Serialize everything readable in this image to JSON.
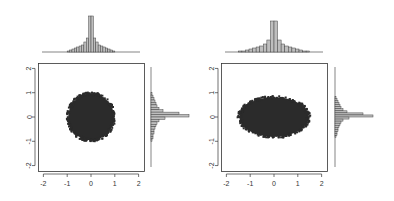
{
  "figure": {
    "colors": {
      "points": "#2b2b2b",
      "bars_fill": "#bebebe",
      "bars_stroke": "#444444",
      "axis": "#333333",
      "background": "#ffffff"
    }
  },
  "chart_data": [
    {
      "type": "scatter",
      "title": "",
      "xlabel": "",
      "ylabel": "",
      "xlim": [
        -2.1,
        2.1
      ],
      "ylim": [
        -2.1,
        2.1
      ],
      "x_ticks": [
        "-2",
        "-1",
        "0",
        "1",
        "2"
      ],
      "y_ticks": [
        "-2",
        "-1",
        "0",
        "1",
        "2"
      ],
      "grid": false,
      "shape": "circle",
      "center": [
        0,
        0
      ],
      "radius_x": 1.0,
      "radius_y": 1.0,
      "marginal_top": {
        "type": "bar",
        "bins": [
          -1.0,
          -0.9,
          -0.8,
          -0.7,
          -0.6,
          -0.5,
          -0.4,
          -0.3,
          -0.2,
          -0.1,
          0.0,
          0.1,
          0.2,
          0.3,
          0.4,
          0.5,
          0.6,
          0.7,
          0.8,
          0.9
        ],
        "values": [
          1,
          2,
          3,
          4,
          5,
          6,
          7,
          10,
          14,
          36,
          36,
          14,
          10,
          7,
          6,
          5,
          4,
          3,
          2,
          1
        ]
      },
      "marginal_right": {
        "type": "bar",
        "bins": [
          1.0,
          0.9,
          0.8,
          0.7,
          0.6,
          0.5,
          0.4,
          0.3,
          0.2,
          0.1,
          0.0,
          -0.1,
          -0.2,
          -0.3,
          -0.4,
          -0.5,
          -0.6,
          -0.7,
          -0.8,
          -0.9
        ],
        "values": [
          1,
          2,
          3,
          4,
          5,
          6,
          8,
          12,
          28,
          38,
          14,
          8,
          6,
          5,
          4,
          3,
          3,
          2,
          2,
          1
        ]
      }
    },
    {
      "type": "scatter",
      "title": "",
      "xlabel": "",
      "ylabel": "",
      "xlim": [
        -2.1,
        2.1
      ],
      "ylim": [
        -2.1,
        2.1
      ],
      "x_ticks": [
        "-2",
        "-1",
        "0",
        "1",
        "2"
      ],
      "y_ticks": [
        "-2",
        "-1",
        "0",
        "1",
        "2"
      ],
      "grid": false,
      "shape": "ellipse",
      "center": [
        0,
        0
      ],
      "radius_x": 1.5,
      "radius_y": 0.85,
      "marginal_top": {
        "type": "bar",
        "bins": [
          -1.5,
          -1.35,
          -1.2,
          -1.05,
          -0.9,
          -0.75,
          -0.6,
          -0.45,
          -0.3,
          -0.15,
          0.0,
          0.15,
          0.3,
          0.45,
          0.6,
          0.75,
          0.9,
          1.05,
          1.2,
          1.35
        ],
        "values": [
          1,
          1,
          2,
          3,
          4,
          5,
          6,
          8,
          12,
          31,
          31,
          12,
          8,
          6,
          5,
          4,
          3,
          2,
          1,
          1
        ]
      },
      "marginal_right": {
        "type": "bar",
        "bins": [
          0.85,
          0.765,
          0.68,
          0.595,
          0.51,
          0.425,
          0.34,
          0.255,
          0.17,
          0.085,
          0.0,
          -0.085,
          -0.17,
          -0.255,
          -0.34,
          -0.425,
          -0.51,
          -0.595,
          -0.68,
          -0.765
        ],
        "values": [
          1,
          2,
          3,
          4,
          5,
          6,
          8,
          12,
          28,
          38,
          14,
          8,
          6,
          5,
          4,
          3,
          3,
          2,
          2,
          1
        ]
      }
    }
  ]
}
